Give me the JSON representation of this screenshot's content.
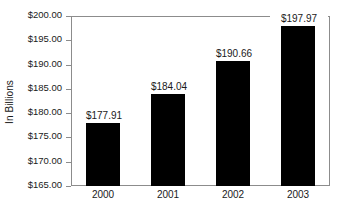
{
  "chart_data": {
    "type": "bar",
    "title": "",
    "xlabel": "",
    "ylabel": "In Billions",
    "categories": [
      "2000",
      "2001",
      "2002",
      "2003"
    ],
    "values": [
      177.91,
      184.04,
      190.66,
      197.97
    ],
    "value_labels": [
      "$177.91",
      "$184.04",
      "$190.66",
      "$197.97"
    ],
    "ylim": [
      165.0,
      200.0
    ],
    "ytick_labels": [
      "$200.00",
      "$195.00",
      "$190.00",
      "$185.00",
      "$180.00",
      "$175.00",
      "$170.00",
      "$165.00"
    ],
    "ytick_values": [
      200.0,
      195.0,
      190.0,
      185.0,
      180.0,
      175.0,
      170.0,
      165.0
    ],
    "grid": false,
    "legend": null,
    "bar_color": "#000000",
    "axis_color": "#8c8c8c",
    "text_color": "#1a1a1a",
    "background": "#ffffff"
  }
}
